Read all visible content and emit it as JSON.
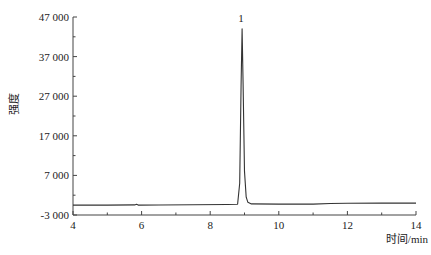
{
  "chart_data": {
    "type": "line",
    "title": "",
    "xlabel": "时间/min",
    "ylabel": "强度",
    "xlim": [
      4,
      14
    ],
    "ylim": [
      -3000,
      47000
    ],
    "xticks": [
      4,
      6,
      8,
      10,
      12,
      14
    ],
    "xtick_labels": [
      "4",
      "6",
      "8",
      "10",
      "12",
      "14"
    ],
    "yticks": [
      -3000,
      7000,
      17000,
      27000,
      37000,
      47000
    ],
    "ytick_labels": [
      "-3 000",
      "7 000",
      "17 000",
      "27 000",
      "37 000",
      "47 000"
    ],
    "grid": false,
    "legend": null,
    "series": [
      {
        "name": "chromatogram",
        "color": "#333333",
        "x": [
          4.0,
          5.0,
          5.8,
          5.85,
          5.9,
          6.5,
          7.5,
          8.5,
          8.8,
          8.86,
          8.9,
          8.93,
          8.96,
          9.0,
          9.05,
          9.1,
          9.2,
          10.0,
          11.0,
          11.5,
          12.0,
          13.0,
          14.0
        ],
        "y": [
          -500,
          -500,
          -450,
          -300,
          -500,
          -480,
          -400,
          -350,
          -300,
          5000,
          30000,
          44000,
          30000,
          8000,
          1500,
          200,
          -200,
          -250,
          -250,
          -100,
          -50,
          0,
          0
        ]
      }
    ],
    "annotations": [
      {
        "text": "1",
        "x": 8.93,
        "y": 46500
      }
    ]
  }
}
